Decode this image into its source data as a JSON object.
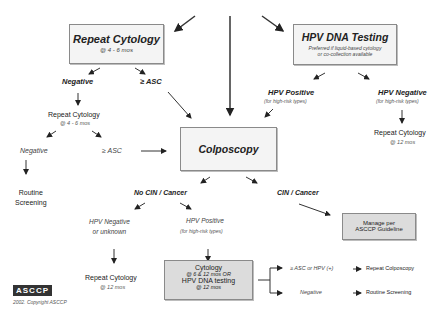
{
  "boxes": {
    "repeat_cytology": {
      "title": "Repeat Cytology",
      "sub": "@ 4 - 6 mos"
    },
    "hpv_dna_testing": {
      "title": "HPV DNA Testing",
      "sub1": "Preferred if liquid-based cytology",
      "sub2": "or co-collection available"
    },
    "colposcopy": {
      "title": "Colposcopy"
    },
    "manage": {
      "line1": "Manage per",
      "line2": "ASCCP Guideline"
    },
    "followup": {
      "line1": "Cytology",
      "line2": "@ 6 & 12 mos OR",
      "line3": "HPV DNA testing",
      "line4": "@ 12 mos"
    }
  },
  "labels": {
    "negative_1": "Negative",
    "asc_1": "≥ ASC",
    "repeat_cytology_2": "Repeat Cytology",
    "repeat_cytology_2_sub": "@ 4 - 6 mos",
    "negative_2": "Negative",
    "asc_2": "≥ ASC",
    "routine_screening_1": "Routine",
    "routine_screening_2": "Screening",
    "hpv_positive": "HPV Positive",
    "hpv_positive_sub": "(for high-risk types)",
    "hpv_negative": "HPV Negative",
    "hpv_negative_sub": "(for high-risk types)",
    "repeat_cytology_12": "Repeat Cytology",
    "repeat_cytology_12_sub": "@ 12 mos",
    "no_cin": "No CIN / Cancer",
    "cin": "CIN / Cancer",
    "hpv_neg_unknown_1": "HPV Negative",
    "hpv_neg_unknown_2": "or unknown",
    "hpv_pos_2": "HPV Positive",
    "hpv_pos_2_sub": "(for high-risk types)",
    "repeat_cytology_12b": "Repeat Cytology",
    "repeat_cytology_12b_sub": "@ 12 mos",
    "asc_or_hpv": "≥ ASC or HPV (+)",
    "repeat_colposcopy": "Repeat Colposcopy",
    "negative_3": "Negative",
    "routine_screening_3": "Routine Screening"
  },
  "footer": {
    "logo": "ASCCP",
    "copyright": "2002. Copyright ASCCP"
  }
}
